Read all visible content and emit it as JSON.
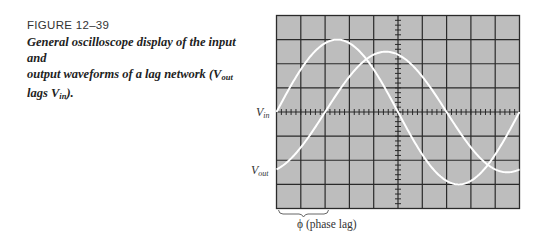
{
  "figure": {
    "title": "FIGURE 12–39",
    "caption_line1": "General oscilloscope display of the input and",
    "caption_line2_pre": "output waveforms of a lag network (V",
    "caption_line2_sub": "out",
    "caption_line3_pre": "lags V",
    "caption_line3_sub": "in",
    "caption_line3_post": ")."
  },
  "scope": {
    "divisions_x": 10,
    "divisions_y": 8,
    "minor_ticks_per_division": 5,
    "screen_color": "#bdbdbd",
    "grid_color": "#2a2a2a",
    "trace_color": "#ffffff",
    "labels": {
      "vin_main": "V",
      "vin_sub": "in",
      "vout_main": "V",
      "vout_sub": "out"
    },
    "phase_label": "ϕ (phase lag)"
  },
  "chart_data": {
    "type": "line",
    "xlabel": "time (divisions)",
    "ylabel": "amplitude (divisions)",
    "xlim": [
      0,
      10
    ],
    "ylim": [
      -4,
      4
    ],
    "grid": true,
    "series": [
      {
        "name": "Vin",
        "waveform": "sine",
        "amplitude_div": 3.0,
        "period_div": 10,
        "phase_offset_div": 0
      },
      {
        "name": "Vout",
        "waveform": "sine",
        "amplitude_div": 2.5,
        "period_div": 10,
        "phase_offset_div": 2,
        "note": "lags Vin"
      }
    ],
    "annotations": [
      {
        "text": "ϕ (phase lag)",
        "span_div": [
          0,
          2
        ]
      }
    ]
  }
}
